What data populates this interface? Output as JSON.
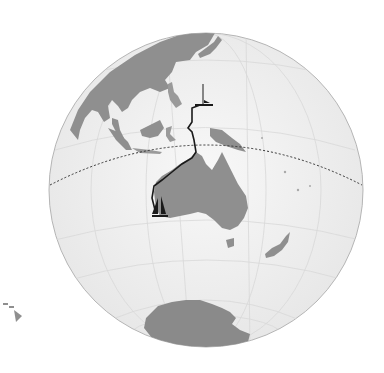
{
  "map": {
    "type": "orthographic-globe",
    "center": "Indian/Pacific Ocean, centered near Australia",
    "colors": {
      "background": "#ffffff",
      "ocean": "#eeeeee",
      "land": "#8f8f8f",
      "graticule": "#d6d6d6",
      "equator": "#333333",
      "route": "#1a1a1a",
      "globe_outline": "#b0b0b0"
    },
    "features": [
      {
        "name": "Asia",
        "kind": "landmass"
      },
      {
        "name": "Japan",
        "kind": "island"
      },
      {
        "name": "Philippines",
        "kind": "islands"
      },
      {
        "name": "Indonesia",
        "kind": "islands"
      },
      {
        "name": "New Guinea",
        "kind": "island"
      },
      {
        "name": "Australia",
        "kind": "landmass"
      },
      {
        "name": "Tasmania",
        "kind": "island"
      },
      {
        "name": "New Zealand",
        "kind": "islands"
      },
      {
        "name": "Antarctica",
        "kind": "landmass"
      },
      {
        "name": "Hawaii",
        "kind": "inset-islands"
      }
    ],
    "overlays": [
      {
        "name": "equator",
        "style": "dotted"
      },
      {
        "name": "route",
        "style": "solid",
        "from": "Western Australia",
        "to": "Western Pacific"
      },
      {
        "name": "sailboat-marker-start",
        "location": "Southwest Australia"
      },
      {
        "name": "sailboat-marker-end",
        "location": "Western Pacific north of New Guinea"
      }
    ]
  }
}
